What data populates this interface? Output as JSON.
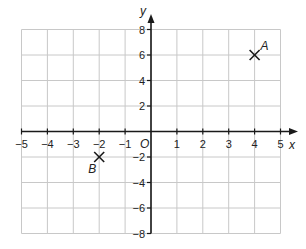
{
  "chart_data": {
    "type": "scatter",
    "title": "",
    "xlabel": "x",
    "ylabel": "y",
    "origin_label": "O",
    "xlim": [
      -5,
      5
    ],
    "ylim": [
      -8,
      8
    ],
    "grid": true,
    "x_ticks": [
      -5,
      -4,
      -3,
      -2,
      -1,
      1,
      2,
      3,
      4,
      5
    ],
    "x_tick_labels": [
      "−5",
      "−4",
      "−3",
      "−2",
      "−1",
      "1",
      "2",
      "3",
      "4",
      "5"
    ],
    "y_ticks": [
      8,
      6,
      4,
      2,
      -2,
      -4,
      -6,
      -8
    ],
    "y_tick_labels": [
      "8",
      "6",
      "4",
      "2",
      "−2",
      "−4",
      "−6",
      "−8"
    ],
    "points": [
      {
        "label": "A",
        "x": 4,
        "y": 6,
        "marker": "x"
      },
      {
        "label": "B",
        "x": -2,
        "y": -2,
        "marker": "x"
      }
    ],
    "colors": {
      "grid": "#c8c8c8",
      "axis": "#1a1a1a",
      "marker": "#1a1a1a"
    }
  }
}
